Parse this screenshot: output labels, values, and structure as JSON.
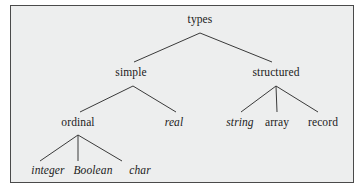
{
  "figure": {
    "kind": "tree-diagram",
    "title": "types",
    "background_color": "#edeeee",
    "border_color": "#4a4a4a",
    "text_color": "#1b1b1b",
    "line_color": "#3a3a3a"
  },
  "nodes": [
    {
      "id": "types",
      "label": "types",
      "style": "roman",
      "x": 200,
      "y": 20,
      "level": 0
    },
    {
      "id": "simple",
      "label": "simple",
      "style": "roman",
      "x": 131,
      "y": 73,
      "level": 1
    },
    {
      "id": "structured",
      "label": "structured",
      "style": "roman",
      "x": 276,
      "y": 73,
      "level": 1
    },
    {
      "id": "ordinal",
      "label": "ordinal",
      "style": "roman",
      "x": 78,
      "y": 123,
      "level": 2
    },
    {
      "id": "real",
      "label": "real",
      "style": "italic",
      "x": 174,
      "y": 123,
      "level": 2
    },
    {
      "id": "string",
      "label": "string",
      "style": "italic",
      "x": 240,
      "y": 123,
      "level": 2
    },
    {
      "id": "array",
      "label": "array",
      "style": "roman",
      "x": 277,
      "y": 123,
      "level": 2
    },
    {
      "id": "record",
      "label": "record",
      "style": "roman",
      "x": 323,
      "y": 123,
      "level": 2
    },
    {
      "id": "integer",
      "label": "integer",
      "style": "italic",
      "x": 48,
      "y": 171,
      "level": 3
    },
    {
      "id": "Boolean",
      "label": "Boolean",
      "style": "italic",
      "x": 93,
      "y": 171,
      "level": 3
    },
    {
      "id": "char",
      "label": "char",
      "style": "italic",
      "x": 140,
      "y": 171,
      "level": 3
    }
  ],
  "edges": [
    {
      "from": "types",
      "to": "simple",
      "x1": 200,
      "y1": 33,
      "x2": 134,
      "y2": 62
    },
    {
      "from": "types",
      "to": "structured",
      "x1": 200,
      "y1": 33,
      "x2": 272,
      "y2": 62
    },
    {
      "from": "simple",
      "to": "ordinal",
      "x1": 133,
      "y1": 86,
      "x2": 80,
      "y2": 112
    },
    {
      "from": "simple",
      "to": "real",
      "x1": 133,
      "y1": 86,
      "x2": 176,
      "y2": 112
    },
    {
      "from": "structured",
      "to": "string",
      "x1": 276,
      "y1": 86,
      "x2": 241,
      "y2": 112
    },
    {
      "from": "structured",
      "to": "array",
      "x1": 276,
      "y1": 86,
      "x2": 277,
      "y2": 112
    },
    {
      "from": "structured",
      "to": "record",
      "x1": 276,
      "y1": 86,
      "x2": 318,
      "y2": 112
    },
    {
      "from": "ordinal",
      "to": "integer",
      "x1": 78,
      "y1": 135,
      "x2": 40,
      "y2": 161
    },
    {
      "from": "ordinal",
      "to": "Boolean",
      "x1": 78,
      "y1": 135,
      "x2": 78,
      "y2": 161
    },
    {
      "from": "ordinal",
      "to": "char",
      "x1": 78,
      "y1": 135,
      "x2": 122,
      "y2": 161
    }
  ]
}
